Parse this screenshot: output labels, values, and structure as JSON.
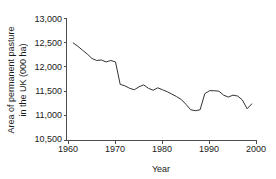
{
  "chart_data": {
    "type": "line",
    "title": "",
    "xlabel": "Year",
    "ylabel": "Area of permanent pasture in the UK (000 ha)",
    "ylabel_line1": "Area of permanent pasture",
    "ylabel_line2": "in the UK (000 ha)",
    "xlim": [
      1960,
      2000
    ],
    "ylim": [
      10500,
      13000
    ],
    "grid": false,
    "legend": null,
    "xticks": [
      1960,
      1970,
      1980,
      1990,
      2000
    ],
    "xtick_labels": [
      "1960",
      "1970",
      "1980",
      "1990",
      "2000"
    ],
    "yticks": [
      10500,
      11000,
      11500,
      12000,
      12500,
      13000
    ],
    "ytick_labels": [
      "10,500",
      "11,000",
      "11,500",
      "12,000",
      "12,500",
      "13,000"
    ],
    "line_color": "#333333",
    "series": [
      {
        "name": "Area of permanent pasture in the UK",
        "x": [
          1961,
          1962,
          1963,
          1964,
          1965,
          1966,
          1967,
          1968,
          1969,
          1970,
          1971,
          1972,
          1973,
          1974,
          1975,
          1976,
          1977,
          1978,
          1979,
          1980,
          1981,
          1982,
          1983,
          1984,
          1985,
          1986,
          1987,
          1988,
          1989,
          1990,
          1991,
          1992,
          1993,
          1994,
          1995,
          1996,
          1997,
          1998,
          1999
        ],
        "values": [
          12500,
          12430,
          12350,
          12270,
          12180,
          12140,
          12150,
          12110,
          12140,
          12110,
          11650,
          11620,
          11570,
          11540,
          11600,
          11640,
          11570,
          11530,
          11580,
          11540,
          11500,
          11450,
          11400,
          11340,
          11240,
          11130,
          11110,
          11130,
          11460,
          11520,
          11520,
          11510,
          11430,
          11390,
          11430,
          11410,
          11330,
          11150,
          11250
        ]
      }
    ]
  }
}
